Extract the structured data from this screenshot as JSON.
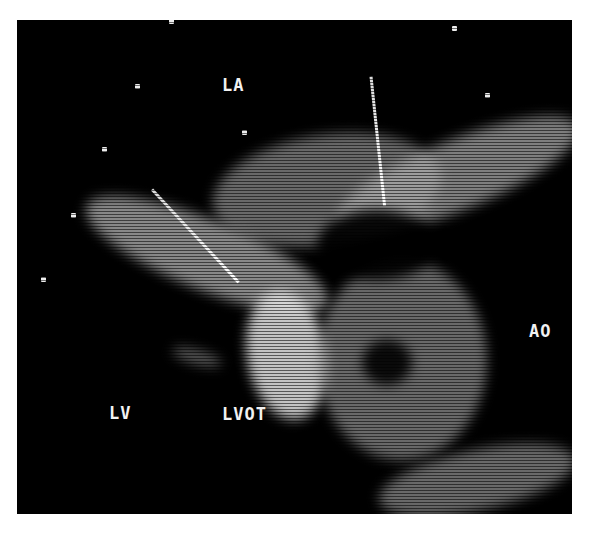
{
  "image": {
    "description": "Black-and-white echocardiogram still (long-axis view) with two white arrows pointing to structures near the left ventricular outflow tract",
    "labels": {
      "la": "LA",
      "lv": "LV",
      "lvot": "LVOT",
      "ao": "AO"
    },
    "colors": {
      "background": "#000000",
      "tissue": "#bfbfbf",
      "page": "#ffffff"
    }
  }
}
